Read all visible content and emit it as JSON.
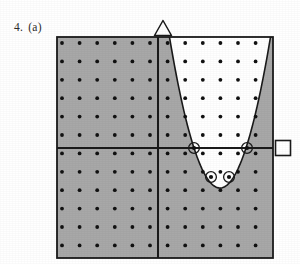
{
  "figure": {
    "problem_number": "4.",
    "part_label": "(a)",
    "caption": "4.  (a)"
  },
  "colors": {
    "shaded_region": "#a8a8a8",
    "unshaded_region": "#ffffff",
    "axis": "#1a1a1a",
    "border": "#1a1a1a",
    "lattice_dot": "#111111",
    "curve": "#1a1a1a",
    "page_background": "#ffffff",
    "label_text": "#2b2b2b"
  },
  "plot": {
    "box": {
      "left": 57,
      "top": 37,
      "right": 273,
      "bottom": 258,
      "width": 216,
      "height": 221
    },
    "origin": {
      "x": 158,
      "y": 148
    },
    "grid": {
      "visible": true,
      "style": "lattice-dots",
      "dot_radius": 1.9,
      "x_start": 62,
      "y_start": 43,
      "x_spacing": 17.6,
      "y_spacing": 18.4,
      "columns": 13,
      "rows": 12
    },
    "axes": {
      "x_axis": {
        "y": 148,
        "from_x": 57,
        "to_x": 273,
        "stroke_width": 2
      },
      "y_axis": {
        "x": 158,
        "from_y": 37,
        "to_y": 258,
        "stroke_width": 2
      }
    }
  },
  "chart_data": {
    "type": "scatter",
    "xlabel": "",
    "ylabel": "",
    "grid": true,
    "legend": false,
    "regions": [
      {
        "name": "shaded-region",
        "fill": "#a8a8a8",
        "meaning": "excluded / shaded area: the left half-plane together with the area below the parabola"
      },
      {
        "name": "unshaded-region",
        "fill": "#ffffff",
        "meaning": "solution area: right of the y-axis and above the parabola"
      }
    ],
    "curve": {
      "name": "parabola",
      "orientation": "opens-upward",
      "vertex_px": [
        220,
        188
      ],
      "x_intercepts_px": [
        194,
        247
      ],
      "top_left_px": [
        172,
        37
      ],
      "top_right_px": [
        273,
        93
      ],
      "style": "solid",
      "stroke": "#1a1a1a"
    },
    "marked_points": {
      "label": "ringed lattice points",
      "marker": "dot-with-circle",
      "count": 4,
      "points_px": [
        {
          "x": 194,
          "y": 148
        },
        {
          "x": 247,
          "y": 148
        },
        {
          "x": 211,
          "y": 177
        },
        {
          "x": 229,
          "y": 177
        }
      ]
    }
  },
  "markers": {
    "triangle": {
      "name": "triangle-marker",
      "shape": "triangle-outline",
      "position_px": {
        "x": 163,
        "y": 28
      },
      "size": 17,
      "stroke": "#1a1a1a",
      "fill": "#ffffff",
      "location": "top edge, on the y-axis"
    },
    "square": {
      "name": "square-marker",
      "shape": "square-outline",
      "position_px": {
        "x": 283,
        "y": 148
      },
      "size": 15,
      "stroke": "#1a1a1a",
      "fill": "#ffffff",
      "location": "right edge, on the x-axis"
    }
  }
}
